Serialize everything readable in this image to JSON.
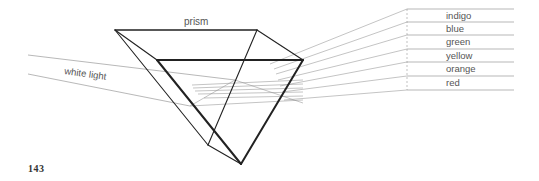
{
  "figure": {
    "title_label": "prism",
    "incoming_label": "white light",
    "page_number": "143",
    "spectrum": [
      {
        "name": "indigo",
        "label": "indigo"
      },
      {
        "name": "blue",
        "label": "blue"
      },
      {
        "name": "green",
        "label": "green"
      },
      {
        "name": "yellow",
        "label": "yellow"
      },
      {
        "name": "orange",
        "label": "orange"
      },
      {
        "name": "red",
        "label": "red"
      }
    ],
    "colors": {
      "prism_edge": "#222222",
      "ray_line": "#888888",
      "label_text": "#555555"
    }
  }
}
